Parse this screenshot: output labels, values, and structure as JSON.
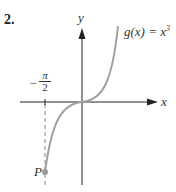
{
  "problem": {
    "number": "2.",
    "function_label": "g(x) = x",
    "function_exponent": "3",
    "x_axis_label": "x",
    "y_axis_label": "y",
    "tick_label": {
      "sign": "−",
      "numerator": "π",
      "denominator": "2"
    },
    "point_label": "P"
  },
  "colors": {
    "axes": "#222222",
    "curve": "#a0a0a0",
    "point": "#9a9a9a",
    "dashed": "#888888"
  }
}
